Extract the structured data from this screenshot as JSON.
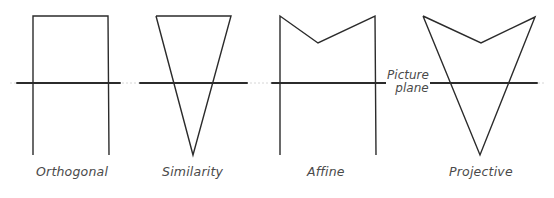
{
  "diagram": {
    "picture_plane": {
      "label_line1": "Picture",
      "label_line2": "plane",
      "y": 83,
      "segments": [
        [
          17,
          120
        ],
        [
          140,
          247
        ],
        [
          272,
          390
        ],
        [
          422,
          537
        ]
      ],
      "color": "#2b2b2b"
    },
    "figures": [
      {
        "name": "Orthogonal",
        "label": "Orthogonal",
        "points": [
          [
            33,
            155
          ],
          [
            33,
            16
          ],
          [
            108,
            16
          ],
          [
            109,
            155
          ]
        ],
        "label_x": 35,
        "label_y": 173
      },
      {
        "name": "Similarity",
        "label": "Similarity",
        "points": [
          [
            156,
            16
          ],
          [
            231,
            16
          ],
          [
            193,
            155
          ],
          [
            156,
            16
          ]
        ],
        "label_x": 162,
        "label_y": 173
      },
      {
        "name": "Affine",
        "label": "Affine",
        "points": [
          [
            280,
            155
          ],
          [
            280,
            16
          ],
          [
            318,
            43
          ],
          [
            375,
            16
          ],
          [
            376,
            155
          ]
        ],
        "label_x": 308,
        "label_y": 173
      },
      {
        "name": "Projective",
        "label": "Projective",
        "points": [
          [
            423,
            16
          ],
          [
            481,
            43
          ],
          [
            535,
            17
          ],
          [
            480,
            155
          ],
          [
            423,
            16
          ]
        ],
        "label_x": 450,
        "label_y": 173
      }
    ],
    "stroke_color": "#2b2b2b"
  }
}
